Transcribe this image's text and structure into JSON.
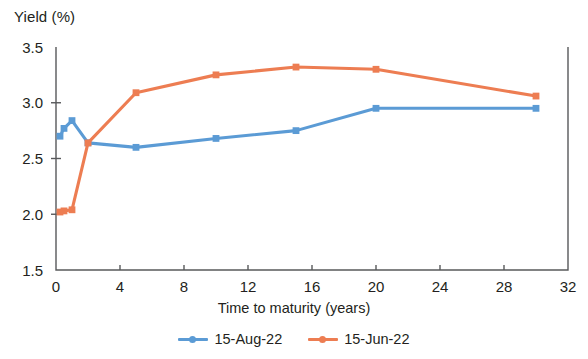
{
  "chart_data": {
    "type": "line",
    "title": "",
    "xlabel": "Time to maturity (years)",
    "ylabel": "Yield (%)",
    "xlim": [
      0,
      32
    ],
    "ylim": [
      1.5,
      3.5
    ],
    "xticks": [
      0,
      4,
      8,
      12,
      16,
      20,
      24,
      28,
      32
    ],
    "xtick_labels": [
      "0",
      "4",
      "8",
      "12",
      "16",
      "20",
      "24",
      "28",
      "32"
    ],
    "yticks": [
      1.5,
      2.0,
      2.5,
      3.0,
      3.5
    ],
    "ytick_labels": [
      "1.5",
      "2.0",
      "2.5",
      "3.0",
      "3.5"
    ],
    "grid": false,
    "legend_position": "bottom-center",
    "marker": "square",
    "series": [
      {
        "name": "15-Aug-22",
        "color": "#5B9BD5",
        "x": [
          0.25,
          0.5,
          1,
          2,
          5,
          10,
          15,
          20,
          30
        ],
        "values": [
          2.7,
          2.77,
          2.84,
          2.64,
          2.6,
          2.68,
          2.75,
          2.95,
          2.95
        ]
      },
      {
        "name": "15-Jun-22",
        "color": "#ED7D52",
        "x": [
          0.25,
          0.5,
          1,
          2,
          5,
          10,
          15,
          20,
          30
        ],
        "values": [
          2.02,
          2.03,
          2.04,
          2.64,
          3.09,
          3.25,
          3.32,
          3.3,
          3.06
        ]
      }
    ]
  },
  "axis": {
    "y_title": "Yield (%)",
    "x_title": "Time to maturity (years)"
  },
  "legend": {
    "items": [
      {
        "label": "15-Aug-22",
        "color": "#5B9BD5"
      },
      {
        "label": "15-Jun-22",
        "color": "#ED7D52"
      }
    ]
  },
  "colors": {
    "series_blue": "#5B9BD5",
    "series_orange": "#ED7D52",
    "axis": "#58595b",
    "text": "#231f20"
  }
}
